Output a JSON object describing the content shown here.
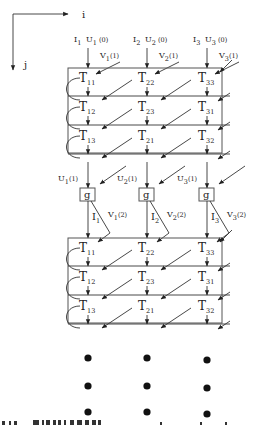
{
  "axes": {
    "horizontal_label": "i",
    "vertical_label": "j"
  },
  "inputs": [
    {
      "I": "I",
      "I_sub": "1",
      "U": "U",
      "U_sub": "1",
      "U_arg": "(0)",
      "V": "V",
      "V_sub": "1",
      "V_arg": "(1)"
    },
    {
      "I": "I",
      "I_sub": "2",
      "U": "U",
      "U_sub": "2",
      "U_arg": "(0)",
      "V": "V",
      "V_sub": "2",
      "V_arg": "(1)"
    },
    {
      "I": "I",
      "I_sub": "3",
      "U": "U",
      "U_sub": "3",
      "U_arg": "(0)",
      "V": "V",
      "V_sub": "3",
      "V_arg": "(1)"
    }
  ],
  "block1": {
    "rows": [
      [
        "11",
        "22",
        "33"
      ],
      [
        "12",
        "23",
        "31"
      ],
      [
        "13",
        "21",
        "32"
      ]
    ],
    "node_letter": "T"
  },
  "outputs1": [
    {
      "U": "U",
      "U_sub": "1",
      "U_arg": "(1)"
    },
    {
      "U": "U",
      "U_sub": "2",
      "U_arg": "(1)"
    },
    {
      "U": "U",
      "U_sub": "3",
      "U_arg": "(1)"
    }
  ],
  "g_nodes": [
    "g",
    "g",
    "g"
  ],
  "inputs2": [
    {
      "I": "I",
      "I_sub": "1",
      "V": "V",
      "V_sub": "1",
      "V_arg": "(2)"
    },
    {
      "I": "I",
      "I_sub": "2",
      "V": "V",
      "V_sub": "2",
      "V_arg": "(2)"
    },
    {
      "I": "I",
      "I_sub": "3",
      "V": "V",
      "V_sub": "3",
      "V_arg": "(2)"
    }
  ],
  "block2": {
    "rows": [
      [
        "11",
        "22",
        "33"
      ],
      [
        "12",
        "23",
        "31"
      ],
      [
        "13",
        "21",
        "32"
      ]
    ],
    "node_letter": "T"
  },
  "continuation": {
    "rows": 3,
    "cols": 3,
    "symbol": "ellipsis-dots"
  }
}
